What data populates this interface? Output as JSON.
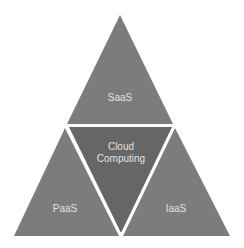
{
  "diagram": {
    "title": "Cloud Computing",
    "segments": [
      {
        "id": "saas",
        "label": "SaaS"
      },
      {
        "id": "paas",
        "label": "PaaS"
      },
      {
        "id": "iaas",
        "label": "IaaS"
      },
      {
        "id": "center",
        "label_line1": "Cloud",
        "label_line2": "Computing"
      }
    ],
    "colors": {
      "outer": "#7c7c7c",
      "center": "#666666",
      "divider": "#ffffff",
      "text": "#e2e2e2"
    }
  }
}
